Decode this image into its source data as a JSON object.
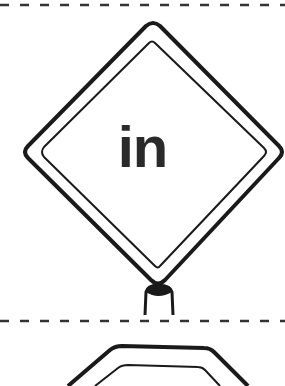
{
  "sheet": {
    "sign": {
      "shape": "diamond",
      "text": "in",
      "stroke_color": "#1a1a1a",
      "text_color": "#2a2a2a"
    },
    "next_sign": {
      "shape": "octagon"
    },
    "cut_lines": [
      "dashed",
      "dashed"
    ],
    "background": "#ffffff"
  }
}
